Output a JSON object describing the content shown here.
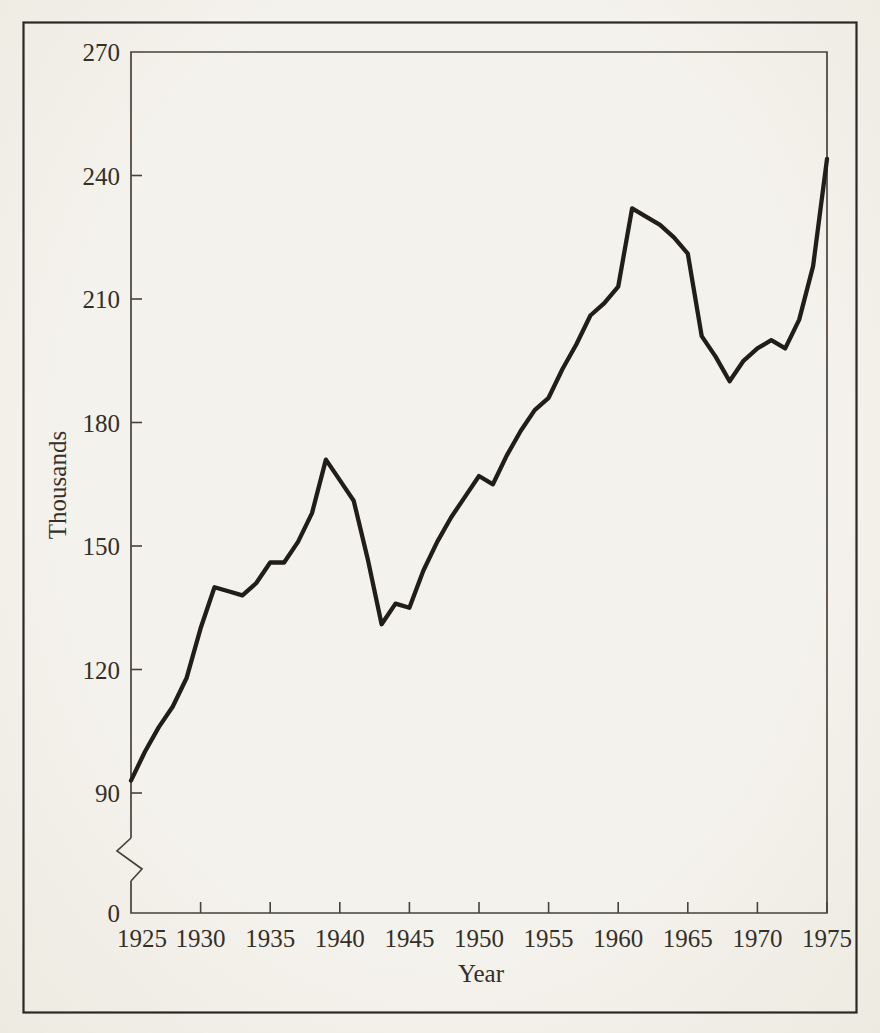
{
  "page": {
    "background_color": "#f2f0e9",
    "border_color": "#2b2823"
  },
  "chart_data": {
    "type": "line",
    "title": "",
    "xlabel": "Year",
    "ylabel": "Thousands",
    "line_color": "#211e1a",
    "grid": false,
    "legend": null,
    "x_ticks": [
      1925,
      1930,
      1935,
      1940,
      1945,
      1950,
      1955,
      1960,
      1965,
      1970,
      1975
    ],
    "y_ticks": [
      0,
      90,
      120,
      150,
      180,
      210,
      240,
      270
    ],
    "xlim": [
      1925,
      1975
    ],
    "ylim": [
      90,
      270
    ],
    "y_axis_break_between": [
      0,
      90
    ],
    "x": [
      1925,
      1926,
      1927,
      1928,
      1929,
      1930,
      1931,
      1932,
      1933,
      1934,
      1935,
      1936,
      1937,
      1938,
      1939,
      1940,
      1941,
      1942,
      1943,
      1944,
      1945,
      1946,
      1947,
      1948,
      1949,
      1950,
      1951,
      1952,
      1953,
      1954,
      1955,
      1956,
      1957,
      1958,
      1959,
      1960,
      1961,
      1962,
      1963,
      1964,
      1965,
      1966,
      1967,
      1968,
      1969,
      1970,
      1971,
      1972,
      1973,
      1974,
      1975
    ],
    "values": [
      93,
      100,
      106,
      111,
      118,
      130,
      140,
      139,
      138,
      141,
      146,
      146,
      151,
      158,
      171,
      166,
      161,
      147,
      131,
      136,
      135,
      144,
      151,
      157,
      162,
      167,
      165,
      172,
      178,
      183,
      186,
      193,
      199,
      206,
      209,
      213,
      232,
      230,
      228,
      225,
      221,
      201,
      196,
      190,
      195,
      198,
      200,
      198,
      205,
      218,
      244
    ]
  }
}
